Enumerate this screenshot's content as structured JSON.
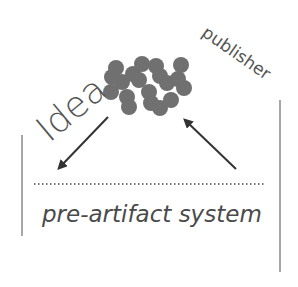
{
  "labels": {
    "idea": "Idea",
    "publisher": "publisher",
    "system": "pre-artifact system"
  },
  "colors": {
    "dots": "#6f6f6f",
    "lines": "#444444",
    "text": "#555555"
  }
}
